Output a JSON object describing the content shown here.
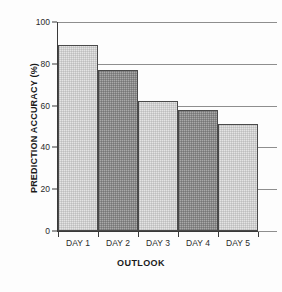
{
  "chart_data": {
    "type": "bar",
    "title": "",
    "xlabel": "OUTLOOK",
    "ylabel": "PREDICTION ACCURACY (%)",
    "categories": [
      "DAY 1",
      "DAY 2",
      "DAY 3",
      "DAY 4",
      "DAY 5"
    ],
    "values": [
      89,
      77,
      62,
      58,
      51
    ],
    "ylim": [
      0,
      100
    ],
    "yticks": [
      0,
      20,
      40,
      60,
      80,
      100
    ],
    "ytick_labels": [
      "0",
      "20",
      "40",
      "60",
      "80",
      "100"
    ],
    "grid": "horizontal",
    "legend": "none",
    "bar_colors": [
      "#e4e4e4",
      "#a9a9a9",
      "#e4e4e4",
      "#a9a9a9",
      "#e4e4e4"
    ],
    "bar_styles": [
      "light",
      "dark",
      "light",
      "dark",
      "light"
    ],
    "bar_edge_color": "#4a4a4a",
    "gridline_color": "#8e8e8e",
    "axis_color": "#3a3a3a",
    "background_color": "#fdfdfd"
  }
}
